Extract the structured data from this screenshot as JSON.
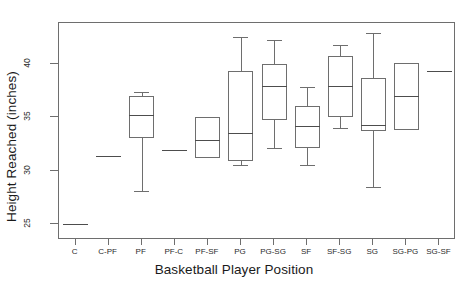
{
  "chart_data": {
    "type": "box",
    "title": "",
    "xlabel": "Basketball Player Position",
    "ylabel": "Height Reached (inches)",
    "ylim": [
      23.5,
      43.8
    ],
    "yticks": [
      25,
      30,
      35,
      40
    ],
    "ytick_labels": [
      "25",
      "30",
      "35",
      "40"
    ],
    "grid": false,
    "legend": null,
    "categories": [
      "C",
      "C-PF",
      "PF",
      "PF-C",
      "PF-SF",
      "PG",
      "PG-SG",
      "SF",
      "SF-SG",
      "SG",
      "SG-PG",
      "SG-SF"
    ],
    "boxes": [
      {
        "category": "C",
        "single_value": 25.0,
        "whisker_low": null,
        "q1": null,
        "median": 25.0,
        "q3": null,
        "whisker_high": null
      },
      {
        "category": "C-PF",
        "single_value": 31.4,
        "whisker_low": null,
        "q1": null,
        "median": 31.4,
        "q3": null,
        "whisker_high": null
      },
      {
        "category": "PF",
        "single_value": null,
        "whisker_low": 28.1,
        "q1": 33.0,
        "median": 35.2,
        "q3": 37.0,
        "whisker_high": 37.3
      },
      {
        "category": "PF-C",
        "single_value": 31.9,
        "whisker_low": null,
        "q1": null,
        "median": 31.9,
        "q3": null,
        "whisker_high": null
      },
      {
        "category": "PF-SF",
        "single_value": null,
        "whisker_low": null,
        "q1": 31.2,
        "median": 32.9,
        "q3": 35.0,
        "whisker_high": null
      },
      {
        "category": "PG",
        "single_value": null,
        "whisker_low": 30.5,
        "q1": 30.9,
        "median": 33.5,
        "q3": 39.3,
        "whisker_high": 42.5
      },
      {
        "category": "PG-SG",
        "single_value": null,
        "whisker_low": 32.1,
        "q1": 34.7,
        "median": 37.9,
        "q3": 40.0,
        "whisker_high": 42.2
      },
      {
        "category": "SF",
        "single_value": null,
        "whisker_low": 30.5,
        "q1": 32.1,
        "median": 34.2,
        "q3": 36.0,
        "whisker_high": 37.8
      },
      {
        "category": "SF-SG",
        "single_value": null,
        "whisker_low": 34.0,
        "q1": 35.0,
        "median": 37.9,
        "q3": 40.7,
        "whisker_high": 41.7
      },
      {
        "category": "SG",
        "single_value": null,
        "whisker_low": 28.5,
        "q1": 33.7,
        "median": 34.3,
        "q3": 38.7,
        "whisker_high": 42.9
      },
      {
        "category": "SG-PG",
        "single_value": null,
        "whisker_low": null,
        "q1": 33.8,
        "median": 37.0,
        "q3": 40.1,
        "whisker_high": null
      },
      {
        "category": "SG-SF",
        "single_value": 39.3,
        "whisker_low": null,
        "q1": null,
        "median": 39.3,
        "q3": null,
        "whisker_high": null
      }
    ]
  }
}
